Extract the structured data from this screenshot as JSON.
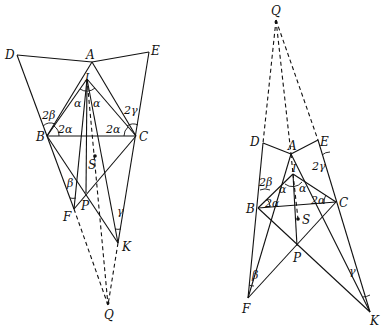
{
  "figures": [
    {
      "id": "left",
      "points": {
        "D": {
          "label": "D",
          "x": 17,
          "y": 55
        },
        "A": {
          "label": "A",
          "x": 92,
          "y": 62
        },
        "E": {
          "label": "E",
          "x": 149,
          "y": 52
        },
        "I": {
          "label": "I",
          "x": 87,
          "y": 79
        },
        "B": {
          "label": "B",
          "x": 47,
          "y": 136
        },
        "C": {
          "label": "C",
          "x": 136,
          "y": 136
        },
        "S": {
          "label": "S",
          "x": 95,
          "y": 156
        },
        "P": {
          "label": "P",
          "x": 86,
          "y": 193
        },
        "F": {
          "label": "F",
          "x": 74,
          "y": 209
        },
        "K": {
          "label": "K",
          "x": 118,
          "y": 243
        },
        "Q": {
          "label": "Q",
          "x": 108,
          "y": 305
        }
      },
      "angle_labels": {
        "alpha_left": "α",
        "alpha_right": "α",
        "two_alpha_B": "2α",
        "two_alpha_C": "2α",
        "two_beta": "2β",
        "two_gamma": "2γ",
        "beta": "β",
        "gamma": "γ"
      }
    },
    {
      "id": "right",
      "points": {
        "Q": {
          "label": "Q",
          "x": 276,
          "y": 20
        },
        "D": {
          "label": "D",
          "x": 263,
          "y": 143
        },
        "A": {
          "label": "A",
          "x": 291,
          "y": 154
        },
        "E": {
          "label": "E",
          "x": 318,
          "y": 140
        },
        "I": {
          "label": "I",
          "x": 293,
          "y": 174
        },
        "B": {
          "label": "B",
          "x": 258,
          "y": 208
        },
        "C": {
          "label": "C",
          "x": 336,
          "y": 202
        },
        "S": {
          "label": "S",
          "x": 298,
          "y": 219
        },
        "P": {
          "label": "P",
          "x": 297,
          "y": 246
        },
        "F": {
          "label": "F",
          "x": 248,
          "y": 298
        },
        "K": {
          "label": "K",
          "x": 370,
          "y": 312
        }
      },
      "angle_labels": {
        "alpha_left": "α",
        "alpha_right": "α",
        "two_alpha_B": "2α",
        "two_alpha_C": "2α",
        "two_beta": "2β",
        "two_gamma": "2γ",
        "beta": "β",
        "gamma": "γ"
      }
    }
  ]
}
